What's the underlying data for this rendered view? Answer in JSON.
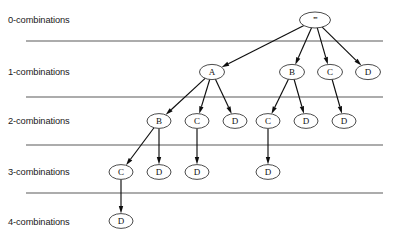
{
  "figure": {
    "width": 393,
    "height": 249,
    "background_color": "#ffffff"
  },
  "style": {
    "line_color": "#5a5a5a",
    "edge_color": "#0d0d0d",
    "node_stroke_color": "#2b2b2b",
    "node_fill_color": "#ffffff",
    "text_color": "#1a1a1a"
  },
  "row_labels": [
    {
      "id": "row-0",
      "text": "0-combinations",
      "x": 8,
      "y": 23
    },
    {
      "id": "row-1",
      "text": "1-combinations",
      "x": 8,
      "y": 75
    },
    {
      "id": "row-2",
      "text": "2-combinations",
      "x": 8,
      "y": 124
    },
    {
      "id": "row-3",
      "text": "3-combinations",
      "x": 8,
      "y": 175
    },
    {
      "id": "row-4",
      "text": "4-combinations",
      "x": 8,
      "y": 225
    }
  ],
  "separators": [
    {
      "id": "sep-0",
      "x1": 26,
      "x2": 383,
      "y": 41
    },
    {
      "id": "sep-1",
      "x1": 26,
      "x2": 383,
      "y": 97
    },
    {
      "id": "sep-2",
      "x1": 26,
      "x2": 383,
      "y": 145
    },
    {
      "id": "sep-3",
      "x1": 26,
      "x2": 383,
      "y": 193
    }
  ],
  "nodes": [
    {
      "id": "n-root",
      "label": "''''",
      "level": 0,
      "cx": 315,
      "cy": 20,
      "rx": 15.5,
      "ry": 8.0,
      "is_root": true
    },
    {
      "id": "n-1-A",
      "label": "A",
      "level": 1,
      "cx": 212,
      "cy": 72,
      "rx": 12.5,
      "ry": 7.6,
      "is_root": false
    },
    {
      "id": "n-1-B",
      "label": "B",
      "level": 1,
      "cx": 292,
      "cy": 72,
      "rx": 12.5,
      "ry": 7.6,
      "is_root": false
    },
    {
      "id": "n-1-C",
      "label": "C",
      "level": 1,
      "cx": 330,
      "cy": 72,
      "rx": 12.5,
      "ry": 7.6,
      "is_root": false
    },
    {
      "id": "n-1-D",
      "label": "D",
      "level": 1,
      "cx": 368,
      "cy": 72,
      "rx": 12.5,
      "ry": 7.6,
      "is_root": false
    },
    {
      "id": "n-2-AB",
      "label": "B",
      "level": 2,
      "cx": 159,
      "cy": 121,
      "rx": 12.0,
      "ry": 7.4,
      "is_root": false
    },
    {
      "id": "n-2-AC",
      "label": "C",
      "level": 2,
      "cx": 197,
      "cy": 121,
      "rx": 12.0,
      "ry": 7.4,
      "is_root": false
    },
    {
      "id": "n-2-AD",
      "label": "D",
      "level": 2,
      "cx": 235,
      "cy": 121,
      "rx": 12.0,
      "ry": 7.4,
      "is_root": false
    },
    {
      "id": "n-2-BC",
      "label": "C",
      "level": 2,
      "cx": 268,
      "cy": 121,
      "rx": 12.0,
      "ry": 7.4,
      "is_root": false
    },
    {
      "id": "n-2-BD",
      "label": "D",
      "level": 2,
      "cx": 306,
      "cy": 121,
      "rx": 12.0,
      "ry": 7.4,
      "is_root": false
    },
    {
      "id": "n-2-CD",
      "label": "D",
      "level": 2,
      "cx": 344,
      "cy": 121,
      "rx": 12.0,
      "ry": 7.4,
      "is_root": false
    },
    {
      "id": "n-3-ABC",
      "label": "C",
      "level": 3,
      "cx": 121,
      "cy": 172,
      "rx": 12.0,
      "ry": 7.4,
      "is_root": false
    },
    {
      "id": "n-3-ABD",
      "label": "D",
      "level": 3,
      "cx": 159,
      "cy": 172,
      "rx": 12.0,
      "ry": 7.4,
      "is_root": false
    },
    {
      "id": "n-3-ACD",
      "label": "D",
      "level": 3,
      "cx": 197,
      "cy": 172,
      "rx": 12.0,
      "ry": 7.4,
      "is_root": false
    },
    {
      "id": "n-3-BCD",
      "label": "D",
      "level": 3,
      "cx": 268,
      "cy": 172,
      "rx": 12.0,
      "ry": 7.4,
      "is_root": false
    },
    {
      "id": "n-4-ABCD",
      "label": "D",
      "level": 4,
      "cx": 121,
      "cy": 221,
      "rx": 12.0,
      "ry": 7.4,
      "is_root": false
    }
  ],
  "edges": [
    {
      "id": "e-root-A",
      "from": "n-root",
      "to": "n-1-A"
    },
    {
      "id": "e-root-B",
      "from": "n-root",
      "to": "n-1-B"
    },
    {
      "id": "e-root-C",
      "from": "n-root",
      "to": "n-1-C"
    },
    {
      "id": "e-root-D",
      "from": "n-root",
      "to": "n-1-D"
    },
    {
      "id": "e-A-B",
      "from": "n-1-A",
      "to": "n-2-AB"
    },
    {
      "id": "e-A-C",
      "from": "n-1-A",
      "to": "n-2-AC"
    },
    {
      "id": "e-A-D",
      "from": "n-1-A",
      "to": "n-2-AD"
    },
    {
      "id": "e-B-C",
      "from": "n-1-B",
      "to": "n-2-BC"
    },
    {
      "id": "e-B-D",
      "from": "n-1-B",
      "to": "n-2-BD"
    },
    {
      "id": "e-C-D",
      "from": "n-1-C",
      "to": "n-2-CD"
    },
    {
      "id": "e-AB-C",
      "from": "n-2-AB",
      "to": "n-3-ABC"
    },
    {
      "id": "e-AB-D",
      "from": "n-2-AB",
      "to": "n-3-ABD"
    },
    {
      "id": "e-AC-D",
      "from": "n-2-AC",
      "to": "n-3-ACD"
    },
    {
      "id": "e-BC-D",
      "from": "n-2-BC",
      "to": "n-3-BCD"
    },
    {
      "id": "e-ABC-D",
      "from": "n-3-ABC",
      "to": "n-4-ABCD"
    }
  ]
}
